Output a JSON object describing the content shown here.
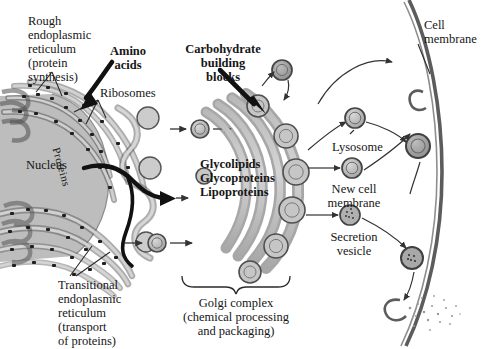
{
  "diagram": {
    "colors": {
      "membrane_gray": "#9a9a9a",
      "lumen_gray": "#c9c9c9",
      "nucleus_gray": "#b8b8b8",
      "outline": "#3a3a3a",
      "ribosome": "#1c1c1c",
      "background": "#ffffff"
    }
  },
  "labels": {
    "rough_er": "Rough\nendoplasmic\nreticulum\n(protein\nsynthesis)",
    "rough_er_lines": [
      "Rough",
      "endoplasmic",
      "reticulum",
      "(protein",
      "synthesis)"
    ],
    "amino_acids": "Amino\nacids",
    "amino_acids_lines": [
      "Amino",
      "acids"
    ],
    "carbohydrate": "Carbohydrate\nbuilding\nblocks",
    "carbohydrate_lines": [
      "Carbohydrate",
      "building",
      "blocks"
    ],
    "ribosomes": "Ribosomes",
    "nucleus": "Nucleus",
    "proteins": "Proteins",
    "products_lines": [
      "Glycolipids",
      "Glycoproteins",
      "Lipoproteins"
    ],
    "lysosome": "Lysosome",
    "new_cell_membrane_lines": [
      "New cell",
      "membrane"
    ],
    "secretion_vesicle_lines": [
      "Secretion",
      "vesicle"
    ],
    "cell_membrane_lines": [
      "Cell",
      "membrane"
    ],
    "transitional_er_lines": [
      "Transitional",
      "endoplasmic",
      "reticulum",
      "(transport",
      "of proteins)"
    ],
    "golgi_lines": [
      "Golgi complex",
      "(chemical processing",
      "and packaging)"
    ]
  }
}
